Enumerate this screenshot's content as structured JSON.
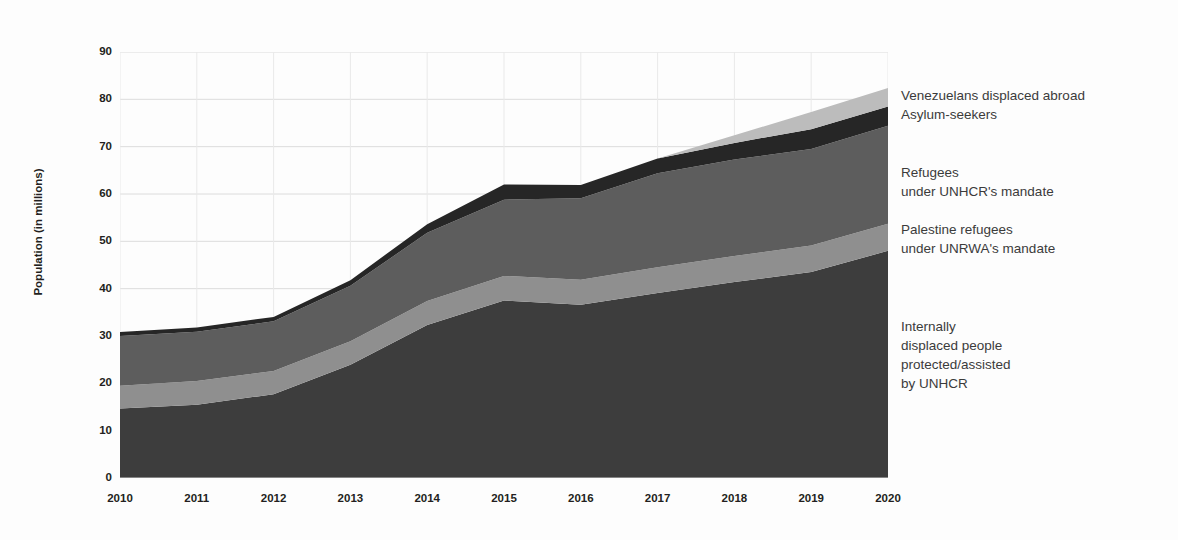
{
  "chart_data": {
    "type": "area",
    "title": "",
    "subtitle": "",
    "xlabel": "",
    "ylabel": "Population (in millions)",
    "xlim": [
      2010,
      2020
    ],
    "ylim": [
      0,
      90
    ],
    "grid": true,
    "stacked": true,
    "legend_position": "right",
    "x": [
      2010,
      2011,
      2012,
      2013,
      2014,
      2015,
      2016,
      2017,
      2018,
      2019,
      2020
    ],
    "categories": [
      "2010",
      "2011",
      "2012",
      "2013",
      "2014",
      "2015",
      "2016",
      "2017",
      "2018",
      "2019",
      "2020"
    ],
    "ytick_labels": [
      "0",
      "10",
      "20",
      "30",
      "40",
      "50",
      "60",
      "70",
      "80",
      "90"
    ],
    "ytick_values": [
      0,
      10,
      20,
      30,
      40,
      50,
      60,
      70,
      80,
      90
    ],
    "series": [
      {
        "name": "Internally displaced people protected/assisted by UNHCR",
        "color": "#3d3d3d",
        "values": [
          14.7,
          15.5,
          17.7,
          23.9,
          32.3,
          37.5,
          36.6,
          39.1,
          41.4,
          43.5,
          48.0
        ]
      },
      {
        "name": "Palestine refugees under UNRWA's mandate",
        "color": "#8f8f8f",
        "values": [
          4.8,
          5.0,
          4.9,
          5.0,
          5.1,
          5.2,
          5.3,
          5.4,
          5.5,
          5.6,
          5.7
        ]
      },
      {
        "name": "Refugees under UNHCR's mandate",
        "color": "#5d5d5d",
        "values": [
          10.5,
          10.4,
          10.5,
          11.7,
          14.4,
          16.1,
          17.2,
          19.9,
          20.4,
          20.4,
          20.7
        ]
      },
      {
        "name": "Asylum-seekers",
        "color": "#262626",
        "values": [
          0.84,
          0.9,
          0.94,
          1.2,
          1.8,
          3.2,
          2.8,
          3.1,
          3.5,
          4.2,
          4.1
        ]
      },
      {
        "name": "Venezuelans displaced abroad",
        "color": "#bcbcbc",
        "values": [
          0,
          0,
          0,
          0,
          0,
          0,
          0,
          0,
          1.6,
          3.6,
          3.9
        ]
      }
    ],
    "totals": [
      30.9,
      31.8,
      34.0,
      41.8,
      53.6,
      62.0,
      61.9,
      67.5,
      72.4,
      77.3,
      82.4
    ]
  },
  "axes": {
    "y_title": "Population (in millions)",
    "y_ticks": [
      "90",
      "80",
      "70",
      "60",
      "50",
      "40",
      "30",
      "20",
      "10",
      "0"
    ],
    "x_ticks": [
      "2010",
      "2011",
      "2012",
      "2013",
      "2014",
      "2015",
      "2016",
      "2017",
      "2018",
      "2019",
      "2020"
    ]
  },
  "legend": {
    "entries": [
      {
        "label": "Venezuelans displaced abroad\nAsylum-seekers",
        "color": "#bcbcbc",
        "top": 34
      },
      {
        "label": "Refugees\nunder UNHCR's mandate",
        "color": "#5d5d5d",
        "top": 111
      },
      {
        "label": "Palestine refugees\nunder UNRWA's mandate",
        "color": "#8f8f8f",
        "top": 168
      },
      {
        "label": "Internally\ndisplaced people\nprotected/assisted\nby UNHCR",
        "color": "#3d3d3d",
        "top": 265
      }
    ]
  },
  "colors": {
    "grid": "#dcdcdc",
    "axis_text": "#231f20",
    "legend_text": "#3b3b3b",
    "background": "#fdfdfd"
  }
}
